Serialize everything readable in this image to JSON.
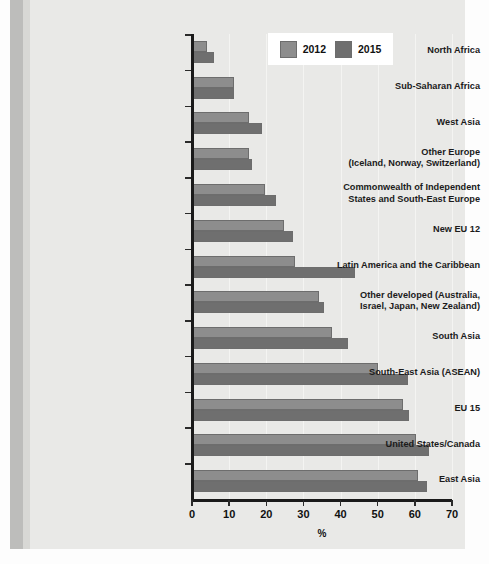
{
  "chart_data": {
    "type": "bar",
    "orientation": "horizontal",
    "title": "",
    "xlabel": "%",
    "ylabel": "",
    "xlim": [
      0,
      70
    ],
    "xticks": [
      0,
      10,
      20,
      30,
      40,
      50,
      60,
      70
    ],
    "xtick_labels": [
      "0",
      "10",
      "20",
      "30",
      "40",
      "50",
      "60",
      "70"
    ],
    "grid": true,
    "legend_position": "top-right",
    "categories": [
      "North Africa",
      "Sub-Saharan Africa",
      "West Asia",
      "Other Europe\n(Iceland, Norway, Switzerland)",
      "Commonwealth of Independent\nStates and South-East Europe",
      "New EU 12",
      "Latin America and the Caribbean",
      "Other developed (Australia,\nIsrael, Japan, New Zealand)",
      "South Asia",
      "South-East Asia (ASEAN)",
      "EU 15",
      "United States/Canada",
      "East Asia"
    ],
    "series": [
      {
        "name": "2012",
        "color": "#8d8d8d",
        "values": [
          4.0,
          11.2,
          15.3,
          15.3,
          19.6,
          24.7,
          27.7,
          34.1,
          37.6,
          50.0,
          56.7,
          60.2,
          60.8
        ]
      },
      {
        "name": "2015",
        "color": "#6f6f6f",
        "values": [
          5.9,
          11.3,
          18.8,
          16.1,
          22.6,
          27.2,
          43.8,
          35.5,
          41.9,
          58.1,
          58.3,
          63.7,
          63.4
        ]
      }
    ]
  },
  "legend": {
    "items": [
      {
        "label": "2012",
        "swatch": "legend-swatch-2012"
      },
      {
        "label": "2015",
        "swatch": "legend-swatch-2015"
      }
    ]
  },
  "axis": {
    "x_title": "%"
  },
  "category_labels": [
    {
      "lines": [
        "North Africa"
      ]
    },
    {
      "lines": [
        "Sub-Saharan Africa"
      ]
    },
    {
      "lines": [
        "West Asia"
      ]
    },
    {
      "lines": [
        "Other Europe",
        "(Iceland, Norway, Switzerland)"
      ]
    },
    {
      "lines": [
        "Commonwealth of Independent",
        "States and South-East Europe"
      ]
    },
    {
      "lines": [
        "New EU 12"
      ]
    },
    {
      "lines": [
        "Latin America and the Caribbean"
      ]
    },
    {
      "lines": [
        "Other developed (Australia,",
        "Israel, Japan, New Zealand)"
      ]
    },
    {
      "lines": [
        "South Asia"
      ]
    },
    {
      "lines": [
        "South-East Asia (ASEAN)"
      ]
    },
    {
      "lines": [
        "EU 15"
      ]
    },
    {
      "lines": [
        "United States/Canada"
      ]
    },
    {
      "lines": [
        "East Asia"
      ]
    }
  ]
}
